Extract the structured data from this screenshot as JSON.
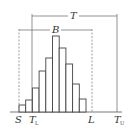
{
  "diagram": {
    "type": "histogram-with-tolerance-limits",
    "labels": {
      "T": "T",
      "B": "B",
      "S": "S",
      "TL_main": "T",
      "TL_sub": "L",
      "L": "L",
      "TU_main": "T",
      "TU_sub": "U"
    },
    "colors": {
      "line": "#555555",
      "bar_stroke": "#444444",
      "bar_fill": "#ffffff",
      "background": "#ffffff"
    }
  },
  "chart_data": {
    "type": "bar",
    "title": "",
    "categories": [
      "1",
      "2",
      "3",
      "4",
      "5",
      "6",
      "7",
      "8",
      "9",
      "10"
    ],
    "values": [
      7,
      12,
      24,
      41,
      54,
      76,
      64,
      48,
      28,
      13
    ],
    "annotations": [
      {
        "label": "S",
        "kind": "dashed-vertical",
        "meaning": "lower limit of distribution"
      },
      {
        "label": "T_L",
        "kind": "solid-vertical",
        "meaning": "lower tolerance limit"
      },
      {
        "label": "L",
        "kind": "dashed-vertical",
        "meaning": "upper limit of distribution"
      },
      {
        "label": "T_U",
        "kind": "solid-vertical",
        "meaning": "upper tolerance limit"
      },
      {
        "label": "T",
        "kind": "bracket",
        "span": [
          "T_L",
          "T_U"
        ]
      },
      {
        "label": "B",
        "kind": "bracket",
        "span": [
          "S",
          "L"
        ]
      }
    ]
  }
}
